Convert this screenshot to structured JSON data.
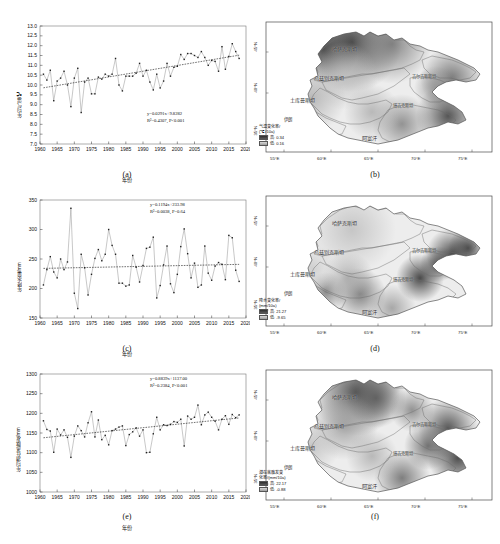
{
  "figure": {
    "topnote": "",
    "caption": ""
  },
  "panels": [
    {
      "id": "a",
      "label": "(a)"
    },
    {
      "id": "b",
      "label": "(b)"
    },
    {
      "id": "c",
      "label": "(c)"
    },
    {
      "id": "d",
      "label": "(d)"
    },
    {
      "id": "e",
      "label": "(e)"
    },
    {
      "id": "f",
      "label": "(f)"
    }
  ],
  "chart_data": [
    {
      "type": "line",
      "panel": "(a)",
      "title": "",
      "xlabel": "年份",
      "ylabel": "年均气温/℃",
      "xlim": [
        1960,
        2020
      ],
      "ylim": [
        7.0,
        13.0
      ],
      "xticks": [
        1960,
        1965,
        1970,
        1975,
        1980,
        1985,
        1990,
        1995,
        2000,
        2005,
        2010,
        2015,
        2020
      ],
      "yticks": [
        7.0,
        7.5,
        8.0,
        8.5,
        9.0,
        9.5,
        10.0,
        10.5,
        11.0,
        11.5,
        12.0,
        12.5,
        13.0
      ],
      "grid": false,
      "legend": "none",
      "annotations": {
        "equation": "y=0.0291x+9.8282",
        "r2": "R²=0.4307, P<0.001"
      },
      "trend": {
        "slope": 0.0291,
        "intercept": 9.8282,
        "r2": 0.4307,
        "p": "<0.001"
      },
      "x": [
        1961,
        1962,
        1963,
        1964,
        1965,
        1966,
        1967,
        1968,
        1969,
        1970,
        1971,
        1972,
        1973,
        1974,
        1975,
        1976,
        1977,
        1978,
        1979,
        1980,
        1981,
        1982,
        1983,
        1984,
        1985,
        1986,
        1987,
        1988,
        1989,
        1990,
        1991,
        1992,
        1993,
        1994,
        1995,
        1996,
        1997,
        1998,
        1999,
        2000,
        2001,
        2002,
        2003,
        2004,
        2005,
        2006,
        2007,
        2008,
        2009,
        2010,
        2011,
        2012,
        2013,
        2014,
        2015,
        2016,
        2017,
        2018
      ],
      "values": [
        10.55,
        10.25,
        10.75,
        9.2,
        10.2,
        10.35,
        10.7,
        10.0,
        8.9,
        10.35,
        10.85,
        8.6,
        10.15,
        10.35,
        9.55,
        9.55,
        10.4,
        10.3,
        10.55,
        10.45,
        10.55,
        11.35,
        10.0,
        9.7,
        10.45,
        10.45,
        10.45,
        10.6,
        11.1,
        10.45,
        10.75,
        10.15,
        9.75,
        10.55,
        9.85,
        10.2,
        11.1,
        10.45,
        10.9,
        10.95,
        11.55,
        11.3,
        11.6,
        11.6,
        11.5,
        11.4,
        11.7,
        11.4,
        11.0,
        11.25,
        11.2,
        10.7,
        11.95,
        10.8,
        11.45,
        12.1,
        11.7,
        11.35
      ]
    },
    {
      "type": "line",
      "panel": "(c)",
      "title": "",
      "xlabel": "年份",
      "ylabel": "年降水量/mm",
      "xlim": [
        1960,
        2020
      ],
      "ylim": [
        150,
        350
      ],
      "xticks": [
        1960,
        1965,
        1970,
        1975,
        1980,
        1985,
        1990,
        1995,
        2000,
        2005,
        2010,
        2015,
        2020
      ],
      "yticks": [
        150,
        200,
        250,
        300,
        350
      ],
      "grid": false,
      "legend": "none",
      "annotations": {
        "equation": "y=0.1194x+233.98",
        "r2": "R²=0.0038, P=0.64"
      },
      "trend": {
        "slope": 0.1194,
        "intercept": 233.98,
        "r2": 0.0038,
        "p": "0.64"
      },
      "x": [
        1961,
        1962,
        1963,
        1964,
        1965,
        1966,
        1967,
        1968,
        1969,
        1970,
        1971,
        1972,
        1973,
        1974,
        1975,
        1976,
        1977,
        1978,
        1979,
        1980,
        1981,
        1982,
        1983,
        1984,
        1985,
        1986,
        1987,
        1988,
        1989,
        1990,
        1991,
        1992,
        1993,
        1994,
        1995,
        1996,
        1997,
        1998,
        1999,
        2000,
        2001,
        2002,
        2003,
        2004,
        2005,
        2006,
        2007,
        2008,
        2009,
        2010,
        2011,
        2012,
        2013,
        2014,
        2015,
        2016,
        2017,
        2018
      ],
      "values": [
        206,
        232,
        254,
        228,
        218,
        250,
        232,
        245,
        336,
        192,
        166,
        258,
        235,
        189,
        224,
        251,
        266,
        247,
        258,
        300,
        273,
        258,
        209,
        209,
        204,
        206,
        256,
        236,
        211,
        239,
        268,
        270,
        287,
        184,
        205,
        240,
        272,
        208,
        193,
        224,
        271,
        301,
        259,
        218,
        243,
        202,
        206,
        272,
        226,
        214,
        238,
        244,
        241,
        215,
        290,
        286,
        231,
        212
      ]
    },
    {
      "type": "line",
      "panel": "(e)",
      "title": "",
      "xlabel": "年份",
      "ylabel": "年均潜在蒸散发/mm",
      "xlim": [
        1960,
        2020
      ],
      "ylim": [
        1000,
        1300
      ],
      "xticks": [
        1960,
        1965,
        1970,
        1975,
        1980,
        1985,
        1990,
        1995,
        2000,
        2005,
        2010,
        2015,
        2020
      ],
      "yticks": [
        1000,
        1050,
        1100,
        1150,
        1200,
        1250,
        1300
      ],
      "grid": false,
      "legend": "none",
      "annotations": {
        "equation": "y=0.8839x+1137.00",
        "r2": "R²=0.2384, P<0.001"
      },
      "trend": {
        "slope": 0.8839,
        "intercept": 1137.0,
        "r2": 0.2384,
        "p": "<0.001"
      },
      "x": [
        1961,
        1962,
        1963,
        1964,
        1965,
        1966,
        1967,
        1968,
        1969,
        1970,
        1971,
        1972,
        1973,
        1974,
        1975,
        1976,
        1977,
        1978,
        1979,
        1980,
        1981,
        1982,
        1983,
        1984,
        1985,
        1986,
        1987,
        1988,
        1989,
        1990,
        1991,
        1992,
        1993,
        1994,
        1995,
        1996,
        1997,
        1998,
        1999,
        2000,
        2001,
        2002,
        2003,
        2004,
        2005,
        2006,
        2007,
        2008,
        2009,
        2010,
        2011,
        2012,
        2013,
        2014,
        2015,
        2016,
        2017,
        2018
      ],
      "values": [
        1181,
        1159,
        1155,
        1101,
        1160,
        1145,
        1158,
        1139,
        1088,
        1142,
        1168,
        1156,
        1140,
        1176,
        1204,
        1140,
        1183,
        1133,
        1144,
        1120,
        1156,
        1160,
        1165,
        1168,
        1118,
        1146,
        1153,
        1163,
        1142,
        1158,
        1100,
        1101,
        1148,
        1190,
        1158,
        1171,
        1169,
        1172,
        1179,
        1177,
        1185,
        1117,
        1193,
        1185,
        1190,
        1221,
        1171,
        1196,
        1203,
        1190,
        1180,
        1158,
        1185,
        1194,
        1172,
        1197,
        1189,
        1196
      ]
    }
  ],
  "maps": [
    {
      "panel": "(b)",
      "variable": "气温变化率",
      "legend_title_line1": "气温变化率/",
      "legend_title_line2": "(℃/10a)",
      "high_label": "高:",
      "high_value": "0.34",
      "low_label": "低:",
      "low_value": "0.16",
      "x_ticks": [
        "55°E",
        "60°E",
        "65°E",
        "70°E",
        "75°E"
      ],
      "y_ticks": [
        "45°N",
        "40°N",
        "35°N"
      ],
      "countries": [
        "哈萨克斯坦",
        "乌兹别克斯坦",
        "土库曼斯坦",
        "吉尔吉斯斯坦",
        "塔吉克斯坦",
        "阿富汗",
        "伊朗"
      ]
    },
    {
      "panel": "(d)",
      "variable": "降水变化率",
      "legend_title_line1": "降水变化率/",
      "legend_title_line2": "(mm/10a)",
      "high_label": "高:",
      "high_value": "21.27",
      "low_label": "低:",
      "low_value": "-9.65",
      "x_ticks": [
        "55°E",
        "60°E",
        "65°E",
        "70°E",
        "75°E"
      ],
      "y_ticks": [
        "45°N",
        "40°N",
        "35°N"
      ],
      "countries": [
        "哈萨克斯坦",
        "乌兹别克斯坦",
        "土库曼斯坦",
        "吉尔吉斯斯坦",
        "塔吉克斯坦",
        "阿富汗",
        "伊朗"
      ]
    },
    {
      "panel": "(f)",
      "variable": "潜在蒸散发变化率",
      "legend_title_line1": "潜在蒸散发变",
      "legend_title_line2": "化率/(mm/10a)",
      "high_label": "高:",
      "high_value": "22.17",
      "low_label": "低:",
      "low_value": "-0.88",
      "x_ticks": [
        "55°E",
        "60°E",
        "65°E",
        "70°E",
        "75°E"
      ],
      "y_ticks": [
        "45°N",
        "40°N",
        "35°N"
      ],
      "countries": [
        "哈萨克斯坦",
        "乌兹别克斯坦",
        "土库曼斯坦",
        "吉尔吉斯斯坦",
        "塔吉克斯坦",
        "阿富汗",
        "伊朗"
      ]
    }
  ],
  "colors": {
    "line": "#9a9a9a",
    "marker": "#202020",
    "trend": "#111111",
    "frame": "#4a4a4a",
    "map_high": "#3c3c3c",
    "map_low": "#f2f2f2"
  }
}
